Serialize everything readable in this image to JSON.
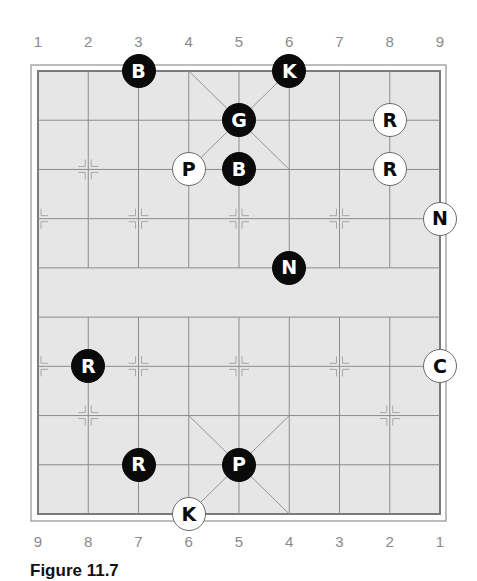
{
  "board": {
    "files_top": [
      "1",
      "2",
      "3",
      "4",
      "5",
      "6",
      "7",
      "8",
      "9"
    ],
    "files_bottom": [
      "9",
      "8",
      "7",
      "6",
      "5",
      "4",
      "3",
      "2",
      "1"
    ],
    "colors": {
      "board_fill": "#e6e6e6",
      "grid_line": "#8c8c8c",
      "border": "#7a7a7a",
      "black_piece": "#0a0a0a",
      "white_piece": "#ffffff"
    },
    "pieces": [
      {
        "label": "B",
        "side": "black",
        "file": 2,
        "rank": 0,
        "name": "black-bishop"
      },
      {
        "label": "K",
        "side": "black",
        "file": 5,
        "rank": 0,
        "name": "black-king"
      },
      {
        "label": "G",
        "side": "black",
        "file": 4,
        "rank": 1,
        "name": "black-guard"
      },
      {
        "label": "R",
        "side": "white",
        "file": 7,
        "rank": 1,
        "name": "white-rook"
      },
      {
        "label": "P",
        "side": "white",
        "file": 3,
        "rank": 2,
        "name": "white-pawn"
      },
      {
        "label": "B",
        "side": "black",
        "file": 4,
        "rank": 2,
        "name": "black-bishop"
      },
      {
        "label": "R",
        "side": "white",
        "file": 7,
        "rank": 2,
        "name": "white-rook"
      },
      {
        "label": "N",
        "side": "white",
        "file": 8,
        "rank": 3,
        "name": "white-knight"
      },
      {
        "label": "N",
        "side": "black",
        "file": 5,
        "rank": 4,
        "name": "black-knight"
      },
      {
        "label": "R",
        "side": "black",
        "file": 1,
        "rank": 6,
        "name": "black-rook"
      },
      {
        "label": "C",
        "side": "white",
        "file": 8,
        "rank": 6,
        "name": "white-cannon"
      },
      {
        "label": "R",
        "side": "black",
        "file": 2,
        "rank": 8,
        "name": "black-rook"
      },
      {
        "label": "P",
        "side": "black",
        "file": 4,
        "rank": 8,
        "name": "black-pawn"
      },
      {
        "label": "K",
        "side": "white",
        "file": 3,
        "rank": 9,
        "name": "white-king"
      }
    ]
  },
  "caption": "Figure 11.7"
}
